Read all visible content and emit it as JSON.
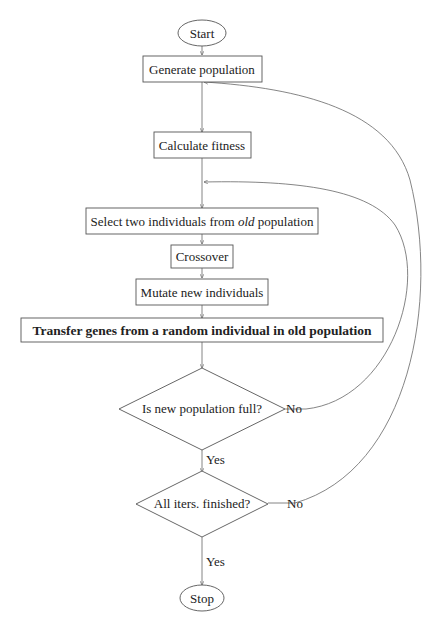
{
  "diagram": {
    "type": "flowchart",
    "nodes": {
      "start": "Start",
      "generate": "Generate population",
      "fitness": "Calculate fitness",
      "select_pre": "Select two individuals from ",
      "select_em": "old",
      "select_post": " population",
      "crossover": "Crossover",
      "mutate": "Mutate new individuals",
      "transfer": "Transfer genes from a random individual in old population",
      "full_q": "Is new population full?",
      "iters_q": "All iters. finished?",
      "stop": "Stop"
    },
    "edge_labels": {
      "full_no": "No",
      "full_yes": "Yes",
      "iters_no": "No",
      "iters_yes": "Yes"
    }
  }
}
